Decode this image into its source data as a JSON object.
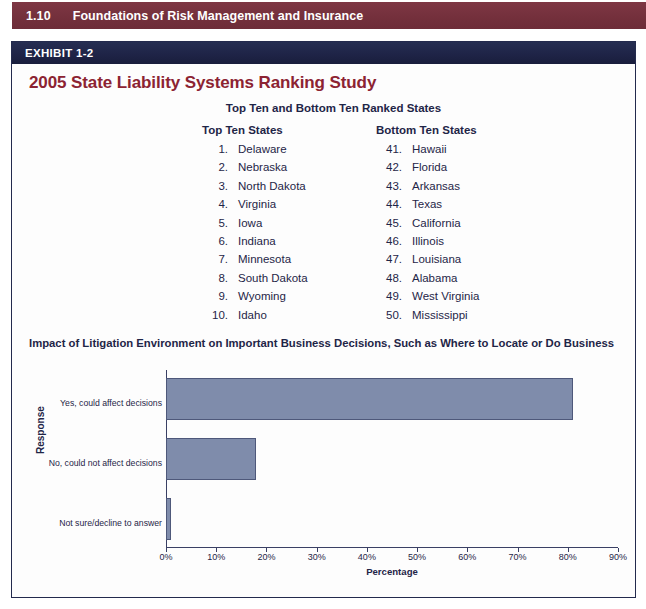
{
  "page_header": {
    "folio": "1.10",
    "running_head": "Foundations of Risk Management and Insurance",
    "background_color": "#74303c"
  },
  "exhibit": {
    "label": "EXHIBIT 1-2",
    "bar_color": "#1e2346",
    "title": "2005 State Liability Systems Ranking Study",
    "title_color": "#8c2332"
  },
  "rankings": {
    "heading": "Top Ten and Bottom Ten Ranked States",
    "top": {
      "heading": "Top Ten States",
      "items": [
        {
          "rank": "1.",
          "state": "Delaware"
        },
        {
          "rank": "2.",
          "state": "Nebraska"
        },
        {
          "rank": "3.",
          "state": "North Dakota"
        },
        {
          "rank": "4.",
          "state": "Virginia"
        },
        {
          "rank": "5.",
          "state": "Iowa"
        },
        {
          "rank": "6.",
          "state": "Indiana"
        },
        {
          "rank": "7.",
          "state": "Minnesota"
        },
        {
          "rank": "8.",
          "state": "South Dakota"
        },
        {
          "rank": "9.",
          "state": "Wyoming"
        },
        {
          "rank": "10.",
          "state": "Idaho"
        }
      ]
    },
    "bottom": {
      "heading": "Bottom Ten States",
      "items": [
        {
          "rank": "41.",
          "state": "Hawaii"
        },
        {
          "rank": "42.",
          "state": "Florida"
        },
        {
          "rank": "43.",
          "state": "Arkansas"
        },
        {
          "rank": "44.",
          "state": "Texas"
        },
        {
          "rank": "45.",
          "state": "California"
        },
        {
          "rank": "46.",
          "state": "Illinois"
        },
        {
          "rank": "47.",
          "state": "Louisiana"
        },
        {
          "rank": "48.",
          "state": "Alabama"
        },
        {
          "rank": "49.",
          "state": "West Virginia"
        },
        {
          "rank": "50.",
          "state": "Mississippi"
        }
      ]
    }
  },
  "chart_data": {
    "type": "bar",
    "orientation": "horizontal",
    "title": "Impact of Litigation Environment on Important Business Decisions, Such as Where to Locate or Do Business",
    "categories": [
      "Yes, could affect decisions",
      "No, could not affect decisions",
      "Not sure/decline to answer"
    ],
    "values": [
      81,
      18,
      1
    ],
    "xlabel": "Percentage",
    "ylabel": "Response",
    "xlim": [
      0,
      90
    ],
    "xticks": [
      0,
      10,
      20,
      30,
      40,
      50,
      60,
      70,
      80,
      90
    ],
    "xtick_labels": [
      "0%",
      "10%",
      "20%",
      "30%",
      "40%",
      "50%",
      "60%",
      "70%",
      "80%",
      "90%"
    ],
    "grid": false,
    "legend": "none",
    "bar_fill_color": "#7f8cab",
    "bar_border_color": "#4e587a"
  }
}
